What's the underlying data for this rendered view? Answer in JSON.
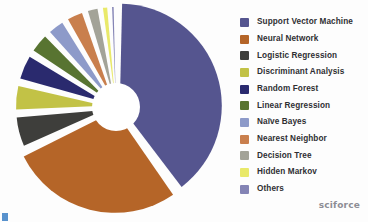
{
  "chart_data": {
    "type": "pie",
    "title": "",
    "subtitle": "",
    "xlabel": "",
    "ylabel": "",
    "legend_position": "right",
    "donut": true,
    "exploded": true,
    "categories": [
      "Support Vector Machine",
      "Neural Network",
      "Logistic Regression",
      "Discriminant Analysis",
      "Random Forest",
      "Linear Regression",
      "Naïve Bayes",
      "Nearest Neighbor",
      "Decision Tree",
      "Hidden Markov",
      "Others"
    ],
    "values": [
      40,
      28,
      6,
      5,
      5,
      4,
      3.5,
      3.5,
      2.5,
      1.5,
      1
    ],
    "colors": [
      "#55558f",
      "#b56528",
      "#3e3e3b",
      "#c2c246",
      "#2a2a6e",
      "#587431",
      "#8d9ac9",
      "#c97f4d",
      "#a3a398",
      "#e9e96a",
      "#8484b5"
    ],
    "slices": [
      {
        "label": "Support Vector Machine",
        "value": 40,
        "color": "#55558f"
      },
      {
        "label": "Neural Network",
        "value": 28,
        "color": "#b56528"
      },
      {
        "label": "Logistic Regression",
        "value": 6,
        "color": "#3e3e3b"
      },
      {
        "label": "Discriminant Analysis",
        "value": 5,
        "color": "#c2c246"
      },
      {
        "label": "Random Forest",
        "value": 5,
        "color": "#2a2a6e"
      },
      {
        "label": "Linear Regression",
        "value": 4,
        "color": "#587431"
      },
      {
        "label": "Naïve Bayes",
        "value": 3.5,
        "color": "#8d9ac9"
      },
      {
        "label": "Nearest Neighbor",
        "value": 3.5,
        "color": "#c97f4d"
      },
      {
        "label": "Decision Tree",
        "value": 2.5,
        "color": "#a3a398"
      },
      {
        "label": "Hidden Markov",
        "value": 1.5,
        "color": "#e9e96a"
      },
      {
        "label": "Others",
        "value": 1,
        "color": "#8484b5"
      }
    ]
  },
  "legend": {
    "items": [
      {
        "label": "Support Vector Machine",
        "color": "#55558f"
      },
      {
        "label": "Neural Network",
        "color": "#b56528"
      },
      {
        "label": "Logistic Regression",
        "color": "#3e3e3b"
      },
      {
        "label": "Discriminant Analysis",
        "color": "#c2c246"
      },
      {
        "label": "Random Forest",
        "color": "#2a2a6e"
      },
      {
        "label": "Linear Regression",
        "color": "#587431"
      },
      {
        "label": "Naïve Bayes",
        "color": "#8d9ac9"
      },
      {
        "label": "Nearest Neighbor",
        "color": "#c97f4d"
      },
      {
        "label": "Decision Tree",
        "color": "#a3a398"
      },
      {
        "label": "Hidden Markov",
        "color": "#e9e96a"
      },
      {
        "label": "Others",
        "color": "#8484b5"
      }
    ]
  },
  "footer": {
    "logo_text": "sciforce"
  },
  "theme": {
    "background": "#fdfdfd",
    "legend_text_color": "#2f2f33",
    "logo_color": "#8d8d95",
    "corner_mark_color": "#3b7fc4"
  }
}
